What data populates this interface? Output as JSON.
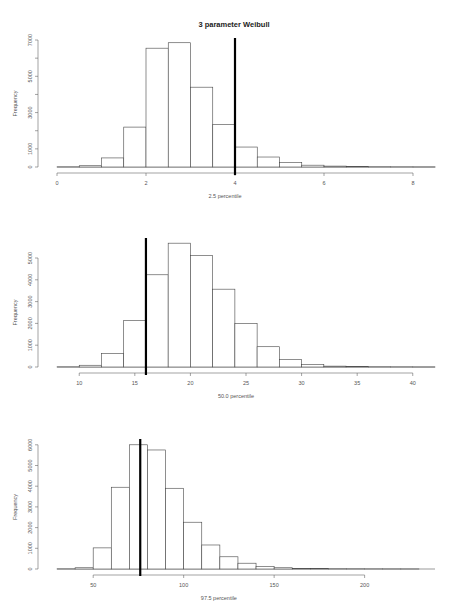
{
  "figure": {
    "header_cut_text": "",
    "title": "3 parameter Weibull"
  },
  "chart_data": [
    {
      "type": "bar",
      "subtype": "histogram",
      "title": "3 parameter Weibull",
      "xlabel": "2.5 percentile",
      "ylabel": "Frequency",
      "xlim": [
        0,
        8.5
      ],
      "ylim": [
        0,
        7000
      ],
      "x_ticks": [
        0,
        2,
        4,
        6,
        8
      ],
      "y_ticks": [
        0,
        1000,
        2000,
        3000,
        4000,
        5000,
        6000,
        7000
      ],
      "y_tick_labels": [
        "0",
        "1000",
        "",
        "3000",
        "",
        "5000",
        "",
        "7000"
      ],
      "bin_width": 0.5,
      "bin_start": 0,
      "values": [
        5,
        70,
        500,
        2200,
        6550,
        6850,
        4400,
        2350,
        1100,
        550,
        250,
        100,
        50,
        20,
        10,
        5,
        3
      ],
      "reference_line_x": 4,
      "grid": false
    },
    {
      "type": "bar",
      "subtype": "histogram",
      "title": "",
      "xlabel": "50.0 percentile",
      "ylabel": "Frequency",
      "xlim": [
        8,
        42
      ],
      "ylim": [
        0,
        5000
      ],
      "x_ticks": [
        10,
        15,
        20,
        25,
        30,
        35,
        40
      ],
      "y_ticks": [
        0,
        1000,
        2000,
        3000,
        4000,
        5000
      ],
      "y_tick_labels": [
        "0",
        "1000",
        "2000",
        "3000",
        "4000",
        "5000"
      ],
      "bin_width": 2,
      "bin_start": 8,
      "values": [
        5,
        80,
        620,
        2130,
        4230,
        5680,
        5120,
        3570,
        2000,
        930,
        340,
        110,
        40,
        15,
        8,
        4,
        2
      ],
      "reference_line_x": 16,
      "grid": false
    },
    {
      "type": "bar",
      "subtype": "histogram",
      "title": "",
      "xlabel": "97.5 percentile",
      "ylabel": "Frequency",
      "xlim": [
        30,
        240
      ],
      "ylim": [
        0,
        6000
      ],
      "x_ticks": [
        50,
        100,
        150,
        200
      ],
      "y_ticks": [
        0,
        1000,
        2000,
        3000,
        4000,
        5000,
        6000
      ],
      "y_tick_labels": [
        "0",
        "1000",
        "2000",
        "3000",
        "4000",
        "5000",
        "6000"
      ],
      "bin_width": 10,
      "bin_start": 30,
      "values": [
        5,
        60,
        1020,
        3950,
        6000,
        5750,
        3900,
        2260,
        1160,
        590,
        280,
        130,
        60,
        30,
        15,
        10,
        8,
        5,
        4,
        3,
        2
      ],
      "reference_line_x": 76,
      "grid": false
    }
  ],
  "layout": [
    {
      "plot_left": 57,
      "plot_right": 435,
      "x_min": 0,
      "x_max": 8.5,
      "x_px_min": 57,
      "x_px_max": 435.25,
      "y_zero_px": 167,
      "px_per_unit_y": 0.01814,
      "axis_y": 173,
      "tick_label_y": 185,
      "xlabel_y": 198,
      "ylabel_x": 17,
      "yaxis_x": 38,
      "yaxis_top": 40,
      "title_y": 27,
      "title_x": 234,
      "ref_top": 38,
      "ref_bottom": 175
    },
    {
      "plot_left": 57,
      "plot_right": 435,
      "x_min": 8,
      "x_max": 42,
      "x_px_min": 57,
      "x_px_max": 435,
      "y_zero_px": 367,
      "px_per_unit_y": 0.0218,
      "axis_y": 373,
      "tick_label_y": 385,
      "xlabel_y": 398,
      "ylabel_x": 17,
      "yaxis_x": 38,
      "yaxis_top": 258,
      "title_y": 0,
      "title_x": 234,
      "ref_top": 238,
      "ref_bottom": 375
    },
    {
      "plot_left": 57,
      "plot_right": 435,
      "x_min": 30,
      "x_max": 240,
      "x_px_min": 57,
      "x_px_max": 437,
      "y_zero_px": 569,
      "px_per_unit_y": 0.0207,
      "axis_y": 575,
      "tick_label_y": 587,
      "xlabel_y": 600,
      "ylabel_x": 17,
      "yaxis_x": 38,
      "yaxis_top": 445,
      "title_y": 0,
      "title_x": 234,
      "ref_top": 439,
      "ref_bottom": 576
    }
  ]
}
